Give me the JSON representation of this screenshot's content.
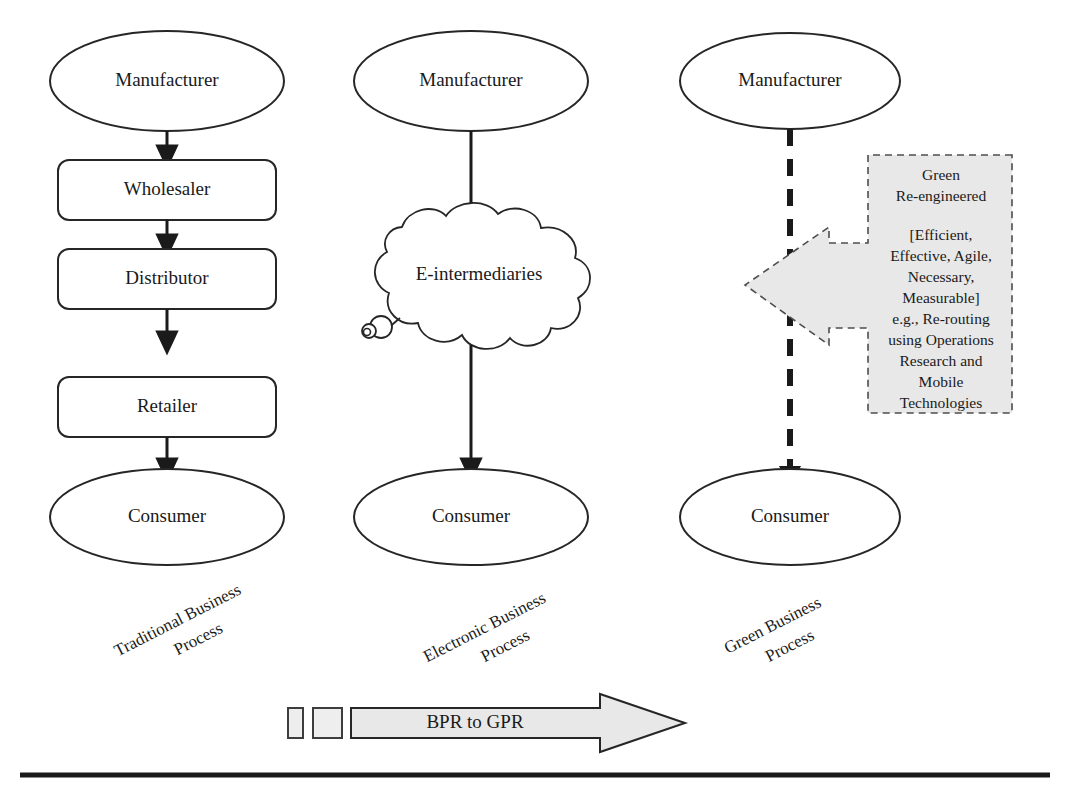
{
  "figure": {
    "columns": [
      {
        "id": "traditional",
        "caption": "Traditional Business Process",
        "caption_line1": "Traditional Business",
        "caption_line2": "Process",
        "nodes": [
          {
            "label": "Manufacturer",
            "shape": "ellipse"
          },
          {
            "label": "Wholesaler",
            "shape": "rounded-rect"
          },
          {
            "label": "Distributor",
            "shape": "rounded-rect"
          },
          {
            "label": "Retailer",
            "shape": "rounded-rect"
          },
          {
            "label": "Consumer",
            "shape": "ellipse"
          }
        ],
        "connector_style": "solid-arrow"
      },
      {
        "id": "electronic",
        "caption": "Electronic Business Process",
        "caption_line1": "Electronic Business",
        "caption_line2": "Process",
        "nodes": [
          {
            "label": "Manufacturer",
            "shape": "ellipse"
          },
          {
            "label": "E-intermediaries",
            "shape": "cloud"
          },
          {
            "label": "Consumer",
            "shape": "ellipse"
          }
        ],
        "connector_style": "solid-arrow"
      },
      {
        "id": "green",
        "caption": "Green Business Process",
        "caption_line1": "Green Business",
        "caption_line2": "Process",
        "nodes": [
          {
            "label": "Manufacturer",
            "shape": "ellipse"
          },
          {
            "label": "Consumer",
            "shape": "ellipse"
          }
        ],
        "connector_style": "dashed-arrow"
      }
    ],
    "callout": {
      "shape": "left-arrow-callout",
      "fill_color": "#e8e8e8",
      "border_style": "dashed",
      "lines": [
        "Green",
        "Re-engineered",
        "",
        "[Efficient,",
        "Effective, Agile,",
        "Necessary,",
        "Measurable]",
        "e.g., Re-routing",
        "using Operations",
        "Research and",
        "Mobile",
        "Technologies"
      ]
    },
    "banner": {
      "label": "BPR  to GPR",
      "shape": "right-arrow",
      "fill_color": "#e8e8e8",
      "markers": [
        "square-small",
        "square-large"
      ]
    }
  }
}
